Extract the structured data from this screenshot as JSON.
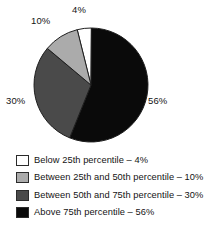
{
  "chart_data": {
    "type": "pie",
    "title": "",
    "subtitle": "",
    "xlabel": "",
    "ylabel": "",
    "grid": false,
    "legend_position": "bottom-left",
    "units": "%",
    "start_angle_deg": -14,
    "direction": "clockwise",
    "categories": [
      "Below 25th percentile",
      "Between 25th and 50th percentile",
      "Between 50th and 75th percentile",
      "Above 75th percentile"
    ],
    "values": [
      4,
      10,
      30,
      56
    ],
    "colors": [
      "#ffffff",
      "#ababab",
      "#4a4a4a",
      "#0a0a0a"
    ],
    "slices": [
      {
        "label": "Below 25th percentile",
        "value": 4,
        "display": "4%",
        "color": "#ffffff"
      },
      {
        "label": "Between 25th and 50th percentile",
        "value": 10,
        "display": "10%",
        "color": "#ababab"
      },
      {
        "label": "Between 50th and 75th percentile",
        "value": 30,
        "display": "30%",
        "color": "#4a4a4a"
      },
      {
        "label": "Above 75th percentile",
        "value": 56,
        "display": "56%",
        "color": "#0a0a0a"
      }
    ],
    "data_labels": [
      {
        "name": "slice-label-4",
        "text": "4%"
      },
      {
        "name": "slice-label-10",
        "text": "10%"
      },
      {
        "name": "slice-label-30",
        "text": "30%"
      },
      {
        "name": "slice-label-56",
        "text": "56%"
      }
    ]
  },
  "pie": {
    "label_4": "4%",
    "label_10": "10%",
    "label_30": "30%",
    "label_56": "56%"
  },
  "legend": {
    "separator": "–",
    "items": [
      {
        "swatch_color": "#ffffff",
        "text": "Below 25th percentile – 4%"
      },
      {
        "swatch_color": "#ababab",
        "text": "Between 25th and 50th percentile – 10%"
      },
      {
        "swatch_color": "#4a4a4a",
        "text": "Between 50th and 75th percentile – 30%"
      },
      {
        "swatch_color": "#0a0a0a",
        "text": "Above 75th percentile – 56%"
      }
    ]
  }
}
